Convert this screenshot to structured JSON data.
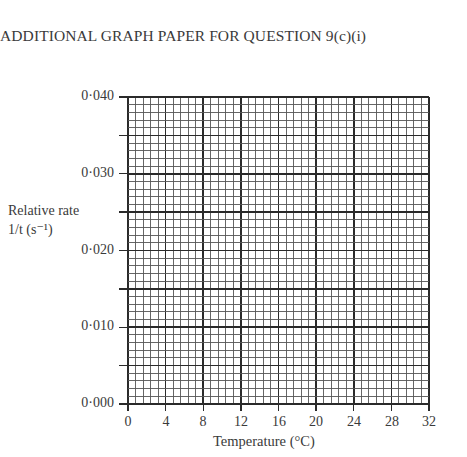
{
  "page": {
    "heading": "ADDITIONAL GRAPH PAPER FOR QUESTION 9(c)(i)"
  },
  "chart_data": {
    "type": "scatter",
    "title": "",
    "xlabel": "Temperature (°C)",
    "ylabel_line1": "Relative rate",
    "ylabel_line2": "1/t (s⁻¹)",
    "x_ticks": [
      "0",
      "4",
      "8",
      "12",
      "16",
      "20",
      "24",
      "28",
      "32"
    ],
    "y_ticks": [
      "0·040",
      "0·030",
      "0·020",
      "0·010",
      "0·000"
    ],
    "xlim": [
      0,
      32
    ],
    "ylim": [
      0,
      0.04
    ],
    "grid": true,
    "grid_major_x_step": 4,
    "grid_minor_x_step": 0.8,
    "grid_major_y_step": 0.005,
    "grid_minor_y_step": 0.001,
    "series": [],
    "note": "Blank graph paper; no data plotted"
  }
}
